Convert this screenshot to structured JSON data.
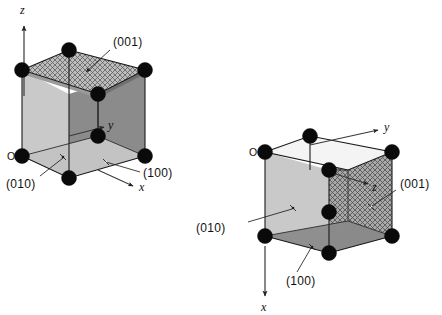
{
  "figure": {
    "background_color": "#ffffff",
    "node_color": "#0a0a0a",
    "edge_color": "#1a1a1a"
  },
  "diagrams": [
    {
      "id": "left-cell",
      "name": "standard-orientation-unit-cell",
      "axes": [
        {
          "name": "z-axis",
          "label": "z",
          "direction": "up"
        },
        {
          "name": "y-axis",
          "label": "y",
          "direction": "right"
        },
        {
          "name": "x-axis",
          "label": "x",
          "direction": "down-right"
        }
      ],
      "origin_label": "O",
      "planes": [
        {
          "name": "plane-001",
          "label": "(001)",
          "face": "top",
          "shading": "cross-hatch"
        },
        {
          "name": "plane-010",
          "label": "(010)",
          "face": "bottom",
          "shading": "light-gray"
        },
        {
          "name": "plane-100",
          "label": "(100)",
          "face": "right",
          "shading": "dark-gray"
        }
      ]
    },
    {
      "id": "right-cell",
      "name": "rotated-orientation-unit-cell",
      "axes": [
        {
          "name": "y-axis",
          "label": "y",
          "direction": "right"
        },
        {
          "name": "z-axis",
          "label": "z",
          "direction": "right-inward"
        },
        {
          "name": "x-axis",
          "label": "x",
          "direction": "down"
        }
      ],
      "origin_label": "O",
      "planes": [
        {
          "name": "plane-001",
          "label": "(001)",
          "face": "right",
          "shading": "cross-hatch"
        },
        {
          "name": "plane-010",
          "label": "(010)",
          "face": "left",
          "shading": "light-gray"
        },
        {
          "name": "plane-100",
          "label": "(100)",
          "face": "bottom",
          "shading": "dark-gray"
        }
      ]
    }
  ],
  "colors": {
    "face_light": "#cdcdcd",
    "face_mid": "#b5b5b5",
    "face_dark": "#8a8a8a",
    "face_darker": "#7d7d7d",
    "hatch_base": "#b9b9b9",
    "hatch_stroke": "#5d5d5d",
    "outline": "#1a1a1a"
  }
}
